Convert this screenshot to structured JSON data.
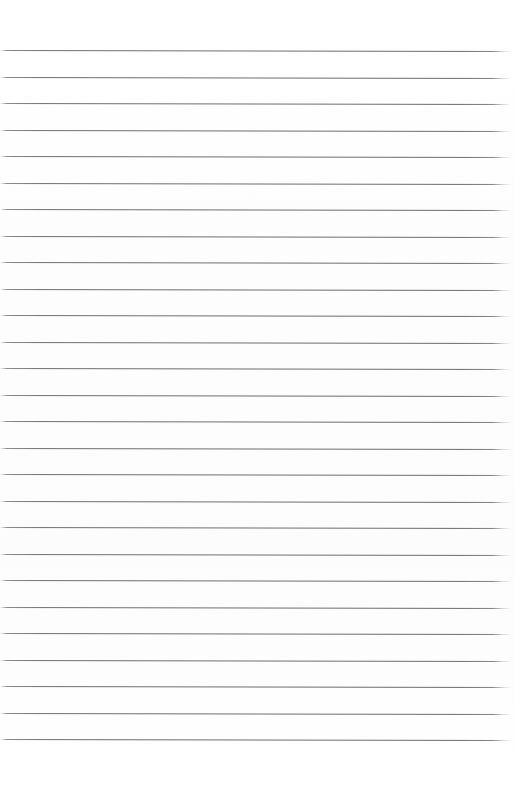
{
  "document": {
    "kind": "scanned-ruled-paper",
    "title": "Blank Ruled Notebook Page",
    "description": "A blank scanned sheet of ruled (lined) writing paper with no handwriting or printed text.",
    "page_width_px": 515,
    "page_height_px": 801,
    "background_color": "#ffffff",
    "has_text_content": "false",
    "handwriting": "none",
    "printed_text": "none",
    "margin_rule": "none",
    "holes_punched": "none"
  },
  "ruling": {
    "line_color": "#6e6e6e",
    "line_thickness_px": 1,
    "line_count": 27,
    "first_line_y_px": 50,
    "last_line_y_px": 738,
    "line_spacing_px": 26.5,
    "line_start_x_px": 0,
    "line_end_x_px": 511,
    "line_style": "solid",
    "edge_treatment": "tapered-fade",
    "skew_degrees": 0.12,
    "line_positions_y": [
      50,
      76.5,
      103,
      129.5,
      156,
      182.5,
      209,
      235.5,
      262,
      288.5,
      315,
      341.5,
      368,
      394.5,
      421,
      447.5,
      474,
      500.5,
      527,
      553.5,
      580,
      606.5,
      633,
      659.5,
      686,
      712.5,
      739
    ]
  },
  "margins": {
    "top_margin_px": 50,
    "bottom_margin_px": 62,
    "left_margin_px": 0,
    "right_margin_px": 4
  }
}
